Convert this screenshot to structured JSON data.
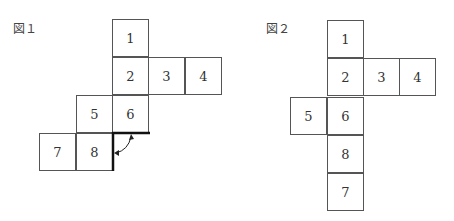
{
  "figure1": {
    "label": "図１",
    "cells": [
      {
        "n": "1",
        "col": 2,
        "row": 0
      },
      {
        "n": "2",
        "col": 2,
        "row": 1
      },
      {
        "n": "3",
        "col": 3,
        "row": 1
      },
      {
        "n": "4",
        "col": 4,
        "row": 1
      },
      {
        "n": "5",
        "col": 1,
        "row": 2
      },
      {
        "n": "6",
        "col": 2,
        "row": 2
      },
      {
        "n": "7",
        "col": 0,
        "row": 3
      },
      {
        "n": "8",
        "col": 1,
        "row": 3
      }
    ],
    "annotation": "bold edges at bottom of 6 and right of 8 with curved double-headed arrow"
  },
  "figure2": {
    "label": "図２",
    "cells": [
      {
        "n": "1",
        "col": 1,
        "row": 0
      },
      {
        "n": "2",
        "col": 1,
        "row": 1
      },
      {
        "n": "3",
        "col": 2,
        "row": 1
      },
      {
        "n": "4",
        "col": 3,
        "row": 1
      },
      {
        "n": "5",
        "col": 0,
        "row": 2
      },
      {
        "n": "6",
        "col": 1,
        "row": 2
      },
      {
        "n": "8",
        "col": 1,
        "row": 3
      },
      {
        "n": "7",
        "col": 1,
        "row": 4
      }
    ]
  }
}
